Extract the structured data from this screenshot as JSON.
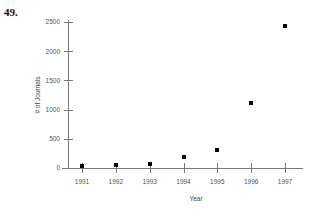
{
  "problem": {
    "number_label": "49."
  },
  "chart_data": {
    "type": "scatter",
    "title": "",
    "xlabel": "Year",
    "ylabel": "# of Journals",
    "categories": [
      1991,
      1992,
      1993,
      1994,
      1995,
      1996,
      1997
    ],
    "x": [
      1991,
      1992,
      1993,
      1994,
      1995,
      1996,
      1997
    ],
    "values": [
      30,
      55,
      60,
      180,
      310,
      1110,
      2440
    ],
    "series": [
      {
        "name": "# of Journals",
        "values": [
          30,
          55,
          60,
          180,
          310,
          1110,
          2440
        ]
      }
    ],
    "xlim": [
      1990.5,
      1997.5
    ],
    "ylim": [
      0,
      2650
    ],
    "yticks": [
      0,
      500,
      1000,
      1500,
      2000,
      2500
    ],
    "ytick_labels": [
      "0",
      "500",
      "1000",
      "1500",
      "2000",
      "2500"
    ],
    "xticks": [
      1991,
      1992,
      1993,
      1994,
      1995,
      1996,
      1997
    ],
    "xtick_labels": [
      "1991",
      "1992",
      "1993",
      "1994",
      "1995",
      "1996",
      "1997"
    ],
    "grid": false,
    "legend": false,
    "legend_position": "none",
    "marker": "square",
    "marker_color": "#000000",
    "axis_color": "#777777"
  }
}
